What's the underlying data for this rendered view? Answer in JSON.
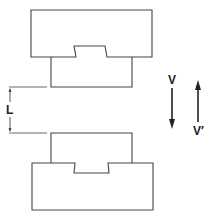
{
  "diagram": {
    "title": "",
    "labels": {
      "gap": "L",
      "velocity_down": "V",
      "velocity_up": "V′"
    },
    "components": {
      "upper_block": "upper block with dovetail notch",
      "upper_insert": "upper insert",
      "lower_insert": "lower insert",
      "lower_block": "lower block with dovetail notch"
    },
    "colors": {
      "stroke": "#444444",
      "background": "#ffffff"
    }
  }
}
